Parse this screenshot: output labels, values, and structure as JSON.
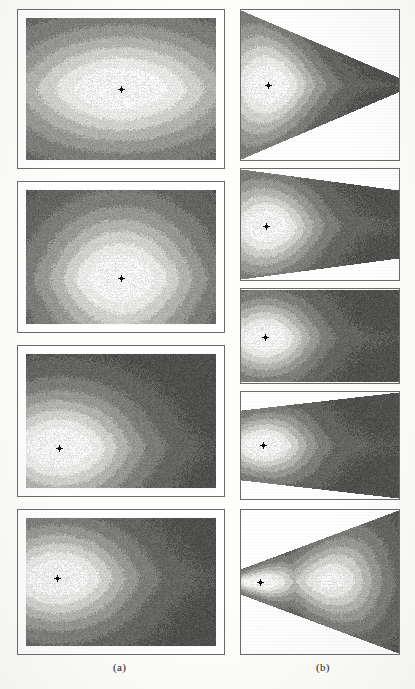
{
  "figure": {
    "background_color": "#fdfdfc",
    "frame_color": "#6a6a68",
    "captions": [
      {
        "id": "caption-a",
        "label": "(a)",
        "x": 113,
        "y": 661
      },
      {
        "id": "caption-b",
        "label": "(b)",
        "x": 316,
        "y": 661
      }
    ]
  },
  "chart_data": {
    "type": "heatmap",
    "title": "",
    "subtitle": "",
    "xlabel": "",
    "ylabel": "",
    "grid": false,
    "legend": "none",
    "colormap": {
      "name": "grayscale-contour-bands",
      "levels": [
        {
          "value": 1.0,
          "color": "#ffffff"
        },
        {
          "value": 0.85,
          "color": "#e8e8e6"
        },
        {
          "value": 0.7,
          "color": "#cfcfcc"
        },
        {
          "value": 0.55,
          "color": "#b2b2ae"
        },
        {
          "value": 0.4,
          "color": "#969692"
        },
        {
          "value": 0.25,
          "color": "#7c7c79"
        },
        {
          "value": 0.12,
          "color": "#646461"
        },
        {
          "value": 0.0,
          "color": "#4f4f4d"
        }
      ]
    },
    "marker": {
      "name": "source-point",
      "color": "#101010",
      "size_px": 3
    },
    "panels": [
      {
        "id": "a1",
        "column": "a",
        "index": 1,
        "shape": "rectangle",
        "geometry": {
          "x": 17,
          "y": 9,
          "w": 208,
          "h": 160
        },
        "mat": true,
        "source": {
          "x": 0.5,
          "y": 0.5
        },
        "peak_value": 1.0,
        "falloff": 0.4,
        "anisotropy": {
          "x": 1.0,
          "y": 0.72
        },
        "background_level": 0.1,
        "description": "Centered isotropic field, concentric diamond contour bands, bright core at centre."
      },
      {
        "id": "a2",
        "column": "a",
        "index": 2,
        "shape": "rectangle",
        "geometry": {
          "x": 17,
          "y": 181,
          "w": 208,
          "h": 152
        },
        "mat": true,
        "source": {
          "x": 0.5,
          "y": 0.66
        },
        "peak_value": 1.0,
        "falloff": 0.34,
        "anisotropy": {
          "x": 0.8,
          "y": 1.05
        },
        "background_level": 0.08,
        "description": "Source displaced below centre, plume of bright contour extending downward."
      },
      {
        "id": "a3",
        "column": "a",
        "index": 3,
        "shape": "rectangle",
        "geometry": {
          "x": 17,
          "y": 345,
          "w": 208,
          "h": 152
        },
        "mat": true,
        "source": {
          "x": 0.175,
          "y": 0.7
        },
        "peak_value": 1.0,
        "falloff": 0.3,
        "anisotropy": {
          "x": 0.9,
          "y": 0.95
        },
        "background_level": 0.06,
        "description": "Source near lower-left corner, broad dark region filling the right two thirds."
      },
      {
        "id": "a4",
        "column": "a",
        "index": 4,
        "shape": "rectangle",
        "geometry": {
          "x": 17,
          "y": 509,
          "w": 208,
          "h": 146
        },
        "mat": true,
        "source": {
          "x": 0.165,
          "y": 0.47
        },
        "peak_value": 1.0,
        "falloff": 0.3,
        "anisotropy": {
          "x": 0.85,
          "y": 0.9
        },
        "background_level": 0.07,
        "description": "Source on the left mid-height, star shaped bright core, dark field to the right."
      },
      {
        "id": "b1",
        "column": "b",
        "index": 1,
        "shape": "wedge-right",
        "geometry": {
          "x": 240,
          "y": 9,
          "w": 160,
          "h": 152
        },
        "mat": false,
        "taper": {
          "left_fraction": 1.0,
          "right_fraction": 0.1
        },
        "source": {
          "x": 0.17,
          "y": 0.5
        },
        "peak_value": 1.0,
        "falloff": 0.3,
        "anisotropy": {
          "x": 0.7,
          "y": 1.0
        },
        "background_level": 0.08,
        "description": "Right-pointing wedge, bright core near the wide left edge."
      },
      {
        "id": "b2",
        "column": "b",
        "index": 2,
        "shape": "wedge-right-shallow",
        "geometry": {
          "x": 240,
          "y": 168,
          "w": 160,
          "h": 113
        },
        "mat": false,
        "taper": {
          "left_fraction": 1.0,
          "right_fraction": 0.62
        },
        "source": {
          "x": 0.16,
          "y": 0.52
        },
        "peak_value": 1.0,
        "falloff": 0.3,
        "anisotropy": {
          "x": 0.7,
          "y": 1.0
        },
        "background_level": 0.08,
        "description": "Shallow right-tapering trapezoid, bright core left of centre."
      },
      {
        "id": "b3",
        "column": "b",
        "index": 3,
        "shape": "rectangle",
        "geometry": {
          "x": 240,
          "y": 288,
          "w": 160,
          "h": 96
        },
        "mat": false,
        "taper": {
          "left_fraction": 1.0,
          "right_fraction": 1.0
        },
        "source": {
          "x": 0.15,
          "y": 0.52
        },
        "peak_value": 1.0,
        "falloff": 0.28,
        "anisotropy": {
          "x": 0.72,
          "y": 1.0
        },
        "background_level": 0.07,
        "description": "Plain rectangular strip, bright core at left mid-height."
      },
      {
        "id": "b4",
        "column": "b",
        "index": 4,
        "shape": "wedge-left",
        "geometry": {
          "x": 240,
          "y": 391,
          "w": 160,
          "h": 109
        },
        "mat": false,
        "taper": {
          "left_fraction": 0.66,
          "right_fraction": 1.0
        },
        "source": {
          "x": 0.14,
          "y": 0.5
        },
        "peak_value": 1.0,
        "falloff": 0.28,
        "anisotropy": {
          "x": 0.7,
          "y": 1.0
        },
        "background_level": 0.07,
        "description": "Left-tapering trapezoid widening to the right, bright core near narrow left edge."
      },
      {
        "id": "b5",
        "column": "b",
        "index": 5,
        "shape": "wedge-left-strong",
        "geometry": {
          "x": 240,
          "y": 509,
          "w": 160,
          "h": 146
        },
        "mat": false,
        "taper": {
          "left_fraction": 0.18,
          "right_fraction": 1.0
        },
        "source": {
          "x": 0.12,
          "y": 0.5
        },
        "second_source": {
          "x": 0.58,
          "y": 0.48
        },
        "peak_value": 1.0,
        "falloff": 0.26,
        "anisotropy": {
          "x": 0.7,
          "y": 1.0
        },
        "background_level": 0.07,
        "description": "Strong left-pointing wedge with two bright cores along the mid-line."
      }
    ]
  }
}
